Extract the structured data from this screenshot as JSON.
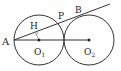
{
  "diagram": {
    "type": "geometry",
    "circles": [
      {
        "name": "O1",
        "label": "O",
        "sub": "1",
        "cx": 39,
        "cy": 40,
        "r": 25
      },
      {
        "name": "O2",
        "label": "O",
        "sub": "2",
        "cx": 89,
        "cy": 40,
        "r": 25
      }
    ],
    "points": {
      "A": {
        "label": "A"
      },
      "P": {
        "label": "P"
      },
      "B": {
        "label": "B"
      },
      "H": {
        "label": "H"
      }
    },
    "stroke_color": "#333333"
  }
}
